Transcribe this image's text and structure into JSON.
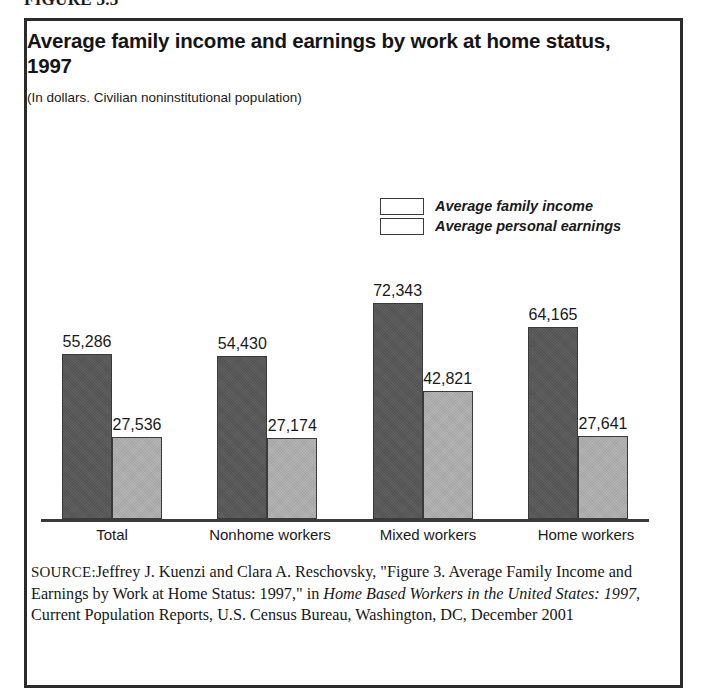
{
  "figure": {
    "number_label": "FIGURE 3.3",
    "title": "Average family income and earnings by work at home status, 1997",
    "subtitle": "(In dollars. Civilian noninstitutional population)"
  },
  "legend": {
    "position": "upper-center-right",
    "entries": [
      {
        "label": "Average family income",
        "color": "#575757",
        "key": "income"
      },
      {
        "label": "Average personal earnings",
        "color": "#adadad",
        "key": "earnings"
      }
    ]
  },
  "source": {
    "label": "SOURCE:",
    "part1": "Jeffrey J. Kuenzi and Clara A. Reschovsky, \"Figure 3. Average Family Income and Earnings by Work at Home Status: 1997,\" in ",
    "italic1": "Home Based Workers in the United States: 1997",
    "part2": ", Current Population Reports, U.S. Census Bureau, Washington, DC, December 2001"
  },
  "chart_data": {
    "type": "bar",
    "title": "Average family income and earnings by work at home status, 1997",
    "subtitle": "(In dollars. Civilian noninstitutional population)",
    "xlabel": "",
    "ylabel": "",
    "units": "dollars",
    "grid": false,
    "axis_ticks_shown": false,
    "ylim": [
      0,
      80000
    ],
    "categories": [
      "Total",
      "Nonhome workers",
      "Mixed workers",
      "Home workers"
    ],
    "series": [
      {
        "name": "Average family income",
        "color": "#575757",
        "values": [
          55286,
          54430,
          72343,
          64165
        ],
        "labels": [
          "55,286",
          "54,430",
          "72,343",
          "64,165"
        ]
      },
      {
        "name": "Average personal earnings",
        "color": "#adadad",
        "values": [
          27536,
          27174,
          42821,
          27641
        ],
        "labels": [
          "27,536",
          "27,174",
          "42,821",
          "27,641"
        ]
      }
    ]
  }
}
